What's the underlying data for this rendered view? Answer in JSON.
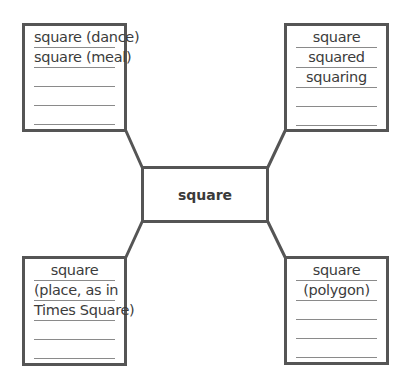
{
  "diagram": {
    "type": "word-map",
    "center": {
      "label": "square"
    },
    "boxes": {
      "top_left": {
        "lines": [
          "square (dance)",
          "square (meal)",
          "",
          "",
          ""
        ]
      },
      "top_right": {
        "lines": [
          "square",
          "squared",
          "squaring",
          "",
          ""
        ]
      },
      "bottom_left": {
        "lines": [
          "square",
          "(place, as in",
          "Times Square)",
          "",
          ""
        ]
      },
      "bottom_right": {
        "lines": [
          "square",
          "(polygon)",
          "",
          "",
          ""
        ]
      }
    },
    "colors": {
      "border": "#555555",
      "rule": "#8a8a8a",
      "text": "#3a3a3a"
    }
  }
}
